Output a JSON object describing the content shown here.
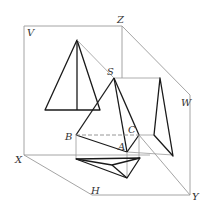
{
  "diagram": {
    "labels": {
      "V": "V",
      "Z": "Z",
      "S": "S",
      "W": "W",
      "X": "X",
      "B": "B",
      "C": "C",
      "A": "A",
      "H": "H",
      "Y": "Y"
    },
    "colors": {
      "object": "#1a1a1a",
      "frame": "#9a9a9a",
      "label": "#333333"
    }
  }
}
